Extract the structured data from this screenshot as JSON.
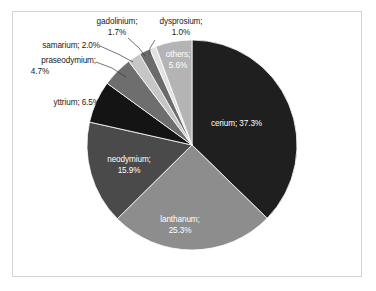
{
  "chart_data": {
    "type": "pie",
    "title": "",
    "subtitle": "",
    "xlabel": "",
    "ylabel": "",
    "legend_position": "none",
    "grid": false,
    "label_format": "name; percent",
    "categories": [
      "cerium",
      "lanthanum",
      "neodymium",
      "yttrium",
      "praseodymium",
      "samarium",
      "gadolinium",
      "dysprosium",
      "others"
    ],
    "values": [
      37.3,
      25.3,
      15.9,
      6.5,
      4.7,
      2.0,
      1.7,
      1.0,
      5.6
    ],
    "unit": "%",
    "slices": [
      {
        "name": "cerium",
        "percent": 37.3,
        "label": "cerium; 37.3%",
        "color": "#1f1f1f",
        "label_placement": "inside",
        "label_color": "#ffffff"
      },
      {
        "name": "lanthanum",
        "percent": 25.3,
        "label": "lanthanum;",
        "label2": "25.3%",
        "color": "#8d8d8d",
        "label_placement": "inside",
        "label_color": "#ffffff"
      },
      {
        "name": "neodymium",
        "percent": 15.9,
        "label": "neodymium;",
        "label2": "15.9%",
        "color": "#4a4a4a",
        "label_placement": "inside",
        "label_color": "#ffffff"
      },
      {
        "name": "yttrium",
        "percent": 6.5,
        "label": "yttrium; 6.5%",
        "color": "#141414",
        "label_placement": "outside",
        "label_color": "#1a1a1a"
      },
      {
        "name": "praseodymium",
        "percent": 4.7,
        "label": "praseodymium;",
        "label2": "4.7%",
        "color": "#6e6e6e",
        "label_placement": "outside",
        "label_color": "#1a1a1a"
      },
      {
        "name": "samarium",
        "percent": 2.0,
        "label": "samarium; 2.0%",
        "color": "#c6c6c6",
        "label_placement": "outside",
        "label_color": "#1a1a1a"
      },
      {
        "name": "gadolinium",
        "percent": 1.7,
        "label": "gadolinium;",
        "label2": "1.7%",
        "color": "#6b6b6b",
        "label_placement": "outside",
        "label_color": "#1a1a1a"
      },
      {
        "name": "dysprosium",
        "percent": 1.0,
        "label": "dysprosium;",
        "label2": "1.0%",
        "color": "#e2e2e2",
        "label_placement": "outside",
        "label_color": "#1a1a1a"
      },
      {
        "name": "others",
        "percent": 5.6,
        "label": "others;",
        "label2": "5.6%",
        "color": "#b4b4b4",
        "label_placement": "inside",
        "label_color": "#ffffff"
      }
    ]
  },
  "labels": {
    "cerium": "cerium; 37.3%",
    "lanthanum_line1": "lanthanum;",
    "lanthanum_line2": "25.3%",
    "neodymium_line1": "neodymium;",
    "neodymium_line2": "15.9%",
    "yttrium": "yttrium; 6.5%",
    "praseodymium_line1": "praseodymium;",
    "praseodymium_line2": "4.7%",
    "samarium": "samarium; 2.0%",
    "gadolinium_line1": "gadolinium;",
    "gadolinium_line2": "1.7%",
    "dysprosium_line1": "dysprosium;",
    "dysprosium_line2": "1.0%",
    "others_line1": "others;",
    "others_line2": "5.6%"
  },
  "colors": {
    "background": "#ffffff",
    "frame_border": "#d4d4d4",
    "leader_line": "#3a3a3a",
    "slice_outline": "#ffffff"
  }
}
